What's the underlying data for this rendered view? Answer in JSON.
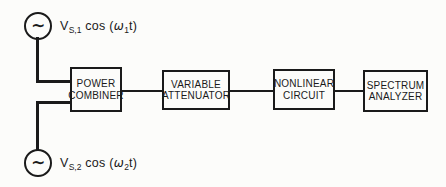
{
  "figure": {
    "background": "#fcfcfa",
    "ink": "#1a1a1a",
    "sources": [
      {
        "symbol": "∼",
        "label": {
          "var": "V",
          "var_sub": "S,1",
          "cos": " cos (",
          "omega": "ω",
          "omega_sub": "1",
          "tail": "t)"
        }
      },
      {
        "symbol": "∼",
        "label": {
          "var": "V",
          "var_sub": "S,2",
          "cos": " cos (",
          "omega": "ω",
          "omega_sub": "2",
          "tail": "t)"
        }
      }
    ],
    "blocks": [
      {
        "id": "power-combiner",
        "lines": [
          "POWER",
          "COMBINER"
        ]
      },
      {
        "id": "variable-attenuator",
        "lines": [
          "VARIABLE",
          "ATTENUATOR"
        ]
      },
      {
        "id": "nonlinear-circuit",
        "lines": [
          "NONLINEAR",
          "CIRCUIT"
        ]
      },
      {
        "id": "spectrum-analyzer",
        "lines": [
          "SPECTRUM",
          "ANALYZER"
        ]
      }
    ]
  }
}
